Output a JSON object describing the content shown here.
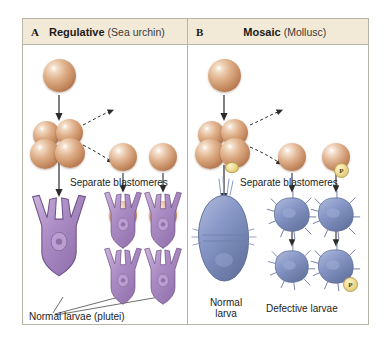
{
  "figure": {
    "panels": [
      {
        "letter": "A",
        "title": "Regulative",
        "subtitle": "(Sea urchin)",
        "separate_label": "Separate blastomeres",
        "outcome_label": "Normal larvae (plutei)",
        "zygote_count": 1,
        "embryo_cells": 4,
        "blastomeres": 4,
        "larvae": 5,
        "larva_color": "#a98cc0",
        "cell_color": "#c78d63"
      },
      {
        "letter": "B",
        "title": "Mosaic",
        "subtitle": "(Mollusc)",
        "separate_label": "Separate blastomeres",
        "normal_label": "Normal\nlarva",
        "defective_label": "Defective larvae",
        "polar_lobe_label": "P",
        "zygote_count": 1,
        "embryo_cells": 4,
        "blastomeres": 4,
        "larvae": 5,
        "larva_color": "#7f8fc0",
        "cell_color": "#c78d63",
        "lobe_color": "#e8d58a"
      }
    ],
    "header_bg": "#f2e9d6",
    "border_color": "#b9b4a8"
  }
}
